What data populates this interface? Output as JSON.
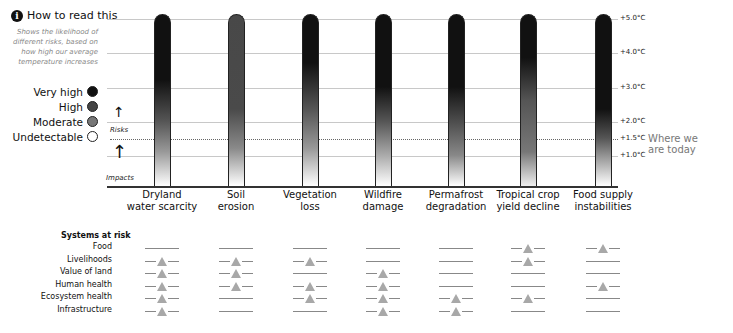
{
  "header": {
    "info_icon": "i",
    "title": "How to read this",
    "subtitle": "Shows the likelihood of different risks, based on how high our average temperature increases"
  },
  "legend": [
    {
      "label": "Very high",
      "color": "#111111"
    },
    {
      "label": "High",
      "color": "#444444"
    },
    {
      "label": "Moderate",
      "color": "#777777"
    },
    {
      "label": "Undetectable",
      "color": "#ffffff"
    }
  ],
  "axis": {
    "risks_label": "Risks",
    "impacts_label": "Impacts",
    "today_label_1": "Where we",
    "today_label_2": "are today",
    "ticks": [
      "+5.0°C",
      "+4.0°C",
      "+3.0°C",
      "+2.0°C",
      "+1.5°C",
      "+1.0°C"
    ]
  },
  "chart_data": {
    "type": "bar",
    "title": "How to read this",
    "ylabel": "Global average temperature increase",
    "ylim": [
      0.0,
      5.0
    ],
    "yticks": [
      "+1.0°C",
      "+1.5°C",
      "+2.0°C",
      "+3.0°C",
      "+4.0°C",
      "+5.0°C"
    ],
    "reference_line": {
      "value": 1.5,
      "label": "Where we are today",
      "style": "dotted"
    },
    "categories": [
      "Dryland water scarcity",
      "Soil erosion",
      "Vegetation loss",
      "Wildfire damage",
      "Permafrost degradation",
      "Tropical crop yield decline",
      "Food supply instabilities"
    ],
    "series": [
      {
        "name": "Risk gradient (dark = very high)",
        "values": [
          5.0,
          5.0,
          5.0,
          5.0,
          5.0,
          5.0,
          5.0
        ]
      }
    ],
    "max_level": [
      "Very high",
      "High",
      "Very high",
      "Very high",
      "Very high",
      "Very high",
      "Very high"
    ],
    "systems_at_risk": {
      "rows": [
        "Food",
        "Livelihoods",
        "Value of land",
        "Human health",
        "Ecosystem health",
        "Infrastructure"
      ],
      "matrix": [
        [
          false,
          false,
          false,
          false,
          false,
          true,
          true
        ],
        [
          true,
          true,
          true,
          false,
          false,
          true,
          false
        ],
        [
          true,
          true,
          false,
          true,
          false,
          false,
          false
        ],
        [
          true,
          true,
          true,
          true,
          false,
          false,
          true
        ],
        [
          true,
          false,
          true,
          true,
          true,
          true,
          false
        ],
        [
          true,
          false,
          false,
          true,
          true,
          false,
          false
        ]
      ]
    }
  },
  "categories": [
    {
      "line1": "Dryland",
      "line2": "water scarcity"
    },
    {
      "line1": "Soil",
      "line2": "erosion"
    },
    {
      "line1": "Vegetation",
      "line2": "loss"
    },
    {
      "line1": "Wildfire",
      "line2": "damage"
    },
    {
      "line1": "Permafrost",
      "line2": "degradation"
    },
    {
      "line1": "Tropical crop",
      "line2": "yield decline"
    },
    {
      "line1": "Food supply",
      "line2": "instabilities"
    }
  ],
  "systems": {
    "title": "Systems at risk",
    "rows": [
      "Food",
      "Livelihoods",
      "Value of land",
      "Human health",
      "Ecosystem health",
      "Infrastructure"
    ]
  }
}
